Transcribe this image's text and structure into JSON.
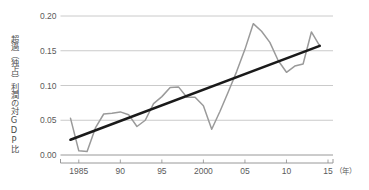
{
  "chart_data": {
    "type": "line",
    "title": "",
    "subtitle": "",
    "xlabel": "年",
    "ylabel": "超過（独占）利潤の対GDP比",
    "xlim": [
      1983.4,
      2015.6
    ],
    "ylim": [
      0.0,
      0.205
    ],
    "grid": "horizontal",
    "legend_position": "none",
    "y_ticks": [
      "0.00",
      "0.05",
      "0.10",
      "0.15",
      "0.20"
    ],
    "y_tick_values": [
      0.0,
      0.05,
      0.1,
      0.15,
      0.2
    ],
    "x_ticks": [
      "1985",
      "90",
      "95",
      "2000",
      "05",
      "10",
      "15"
    ],
    "x_tick_values": [
      1985,
      1990,
      1995,
      2000,
      2005,
      2010,
      2015
    ],
    "x_unit_label": "（年）",
    "series": [
      {
        "name": "超過（独占）利潤の対GDP比",
        "type": "line",
        "color": "#9a9a9a",
        "x": [
          1984,
          1985,
          1986,
          1987,
          1988,
          1989,
          1990,
          1991,
          1992,
          1993,
          1994,
          1995,
          1996,
          1997,
          1998,
          1999,
          2000,
          2001,
          2002,
          2003,
          2004,
          2005,
          2006,
          2007,
          2008,
          2009,
          2010,
          2011,
          2012,
          2013,
          2014
        ],
        "values": [
          0.053,
          0.006,
          0.005,
          0.039,
          0.059,
          0.06,
          0.062,
          0.058,
          0.041,
          0.05,
          0.074,
          0.084,
          0.097,
          0.098,
          0.083,
          0.083,
          0.071,
          0.037,
          0.063,
          0.091,
          0.12,
          0.152,
          0.189,
          0.178,
          0.162,
          0.136,
          0.119,
          0.128,
          0.131,
          0.177,
          0.157
        ]
      },
      {
        "name": "トレンド線",
        "type": "line",
        "color": "#1a1a1a",
        "x": [
          1984,
          2014
        ],
        "values": [
          0.022,
          0.157
        ]
      }
    ]
  },
  "axis": {
    "y_title": "超過（独占）利潤の対GDP比",
    "x_unit": "（年）"
  }
}
